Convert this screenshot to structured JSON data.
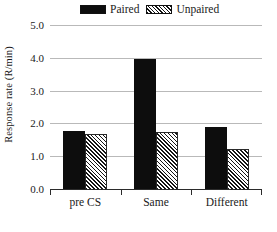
{
  "chart_data": {
    "type": "bar",
    "title": "",
    "xlabel": "",
    "ylabel": "Response rate (R/min)",
    "categories": [
      "pre CS",
      "Same",
      "Different"
    ],
    "series": [
      {
        "name": "Paired",
        "values": [
          1.77,
          3.95,
          1.9
        ],
        "fill": "solid-black",
        "color": "#0d0d0d"
      },
      {
        "name": "Unpaired",
        "values": [
          1.68,
          1.74,
          1.22
        ],
        "fill": "diagonal-hatch",
        "color": "#151515"
      }
    ],
    "ylim": [
      0.0,
      5.0
    ],
    "ytick_values": [
      5.0,
      4.0,
      3.0,
      2.0,
      1.0,
      0.0
    ],
    "ytick_labels": [
      "5.0",
      "4.0",
      "3.0",
      "2.0",
      "1.0",
      "0.0"
    ],
    "grid": true,
    "grid_axis": "y",
    "grid_color": "#b9b9b9",
    "legend_position": "top-center",
    "axis_color": "#2b2b2b",
    "background": "#ffffff"
  },
  "legend": {
    "entries": [
      {
        "label": "Paired"
      },
      {
        "label": "Unpaired"
      }
    ]
  },
  "axes": {
    "y_title": "Response rate (R/min)"
  }
}
